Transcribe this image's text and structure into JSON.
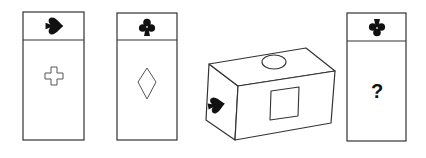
{
  "puzzle": {
    "type": "cube-net-analogy",
    "stroke_color": "#333333",
    "fill_color": "#111111",
    "panels": [
      {
        "id": "panel-1",
        "top_symbol": "spade-icon",
        "top_symbol_rotation": "rotated-90",
        "center_symbol": "cross-outline-icon",
        "center_text": ""
      },
      {
        "id": "panel-2",
        "top_symbol": "club-icon",
        "top_symbol_rotation": "upright",
        "center_symbol": "diamond-outline-icon",
        "center_text": ""
      },
      {
        "id": "panel-4",
        "top_symbol": "club-icon",
        "top_symbol_rotation": "upside-down",
        "center_symbol": "question",
        "center_text": "?"
      }
    ],
    "cube": {
      "top_face_symbol": "ellipse-outline-icon",
      "front_face_symbol": "square-outline-icon",
      "left_face_symbol": "spade-icon"
    }
  }
}
